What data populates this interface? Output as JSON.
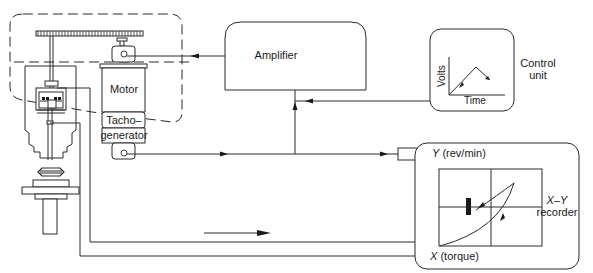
{
  "diagram": {
    "blocks": {
      "motor": {
        "label": "Motor"
      },
      "tachogenerator": {
        "label_line1": "Tacho–",
        "label_line2": "generator"
      },
      "amplifier": {
        "label": "Amplifier"
      },
      "control_unit": {
        "label_line1": "Control",
        "label_line2": "unit",
        "graph": {
          "ylabel": "Volts",
          "xlabel": "Time",
          "shape": "triangle ramp up then down"
        }
      },
      "xy_recorder": {
        "label_line1": "X–Y",
        "label_line2": "recorder",
        "y_input": "Y (rev/min)",
        "x_input": "X (torque)",
        "y_axis_letter": "Y",
        "y_axis_units": "(rev/min)",
        "x_axis_letter": "X",
        "x_axis_units": "(torque)"
      }
    },
    "connections": [
      {
        "from": "amplifier",
        "to": "motor",
        "arrow": "left"
      },
      {
        "from": "control_unit",
        "to": "amplifier",
        "arrow": "left"
      },
      {
        "from": "tachogenerator",
        "to": "amplifier",
        "arrow": "up"
      },
      {
        "from": "tachogenerator",
        "to": "xy_recorder.Y",
        "arrow": "right"
      },
      {
        "from": "torque_sensor",
        "to": "xy_recorder.X",
        "arrow": "right"
      }
    ],
    "colors": {
      "line": "#2a2a2a",
      "background": "#ffffff"
    }
  }
}
